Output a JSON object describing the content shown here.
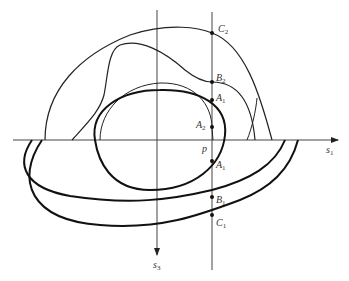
{
  "diagram": {
    "axes": {
      "horizontal": {
        "label": "s",
        "subscript": "1"
      },
      "vertical": {
        "label": "s",
        "subscript": "3"
      }
    },
    "point_p": {
      "label": "p"
    },
    "points": [
      {
        "id": "C2",
        "label": "C",
        "subscript": "2"
      },
      {
        "id": "B2",
        "label": "B",
        "subscript": "2"
      },
      {
        "id": "A1_top",
        "label": "A",
        "subscript": "1"
      },
      {
        "id": "A2",
        "label": "A",
        "subscript": "2"
      },
      {
        "id": "A1_bottom",
        "label": "A",
        "subscript": "1"
      },
      {
        "id": "B1",
        "label": "B",
        "subscript": "1"
      },
      {
        "id": "C1",
        "label": "C",
        "subscript": "1"
      }
    ],
    "colors": {
      "stroke": "#222222",
      "axis": "#444444"
    }
  }
}
